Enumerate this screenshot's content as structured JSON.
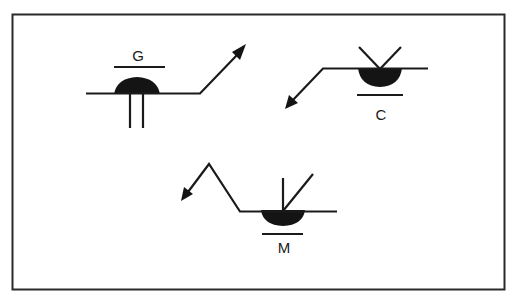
{
  "diagram": {
    "type": "weld-symbol-illustration",
    "colors": {
      "ink": "#1a1a1a",
      "background": "#ffffff"
    },
    "symbols": [
      {
        "id": "G",
        "label": "G",
        "description": "weld symbol with contour bar and letter G above reference line, convex bead, two vertical legs, arrow leader up-right"
      },
      {
        "id": "C",
        "label": "C",
        "description": "weld symbol with V-groove marks above, bead below reference line, contour bar and letter C below, arrow leader down-left"
      },
      {
        "id": "M",
        "label": "M",
        "description": "weld symbol with bevel marks above, bead below reference line, contour bar and letter M below, zig-zag arrow leader left"
      }
    ]
  }
}
